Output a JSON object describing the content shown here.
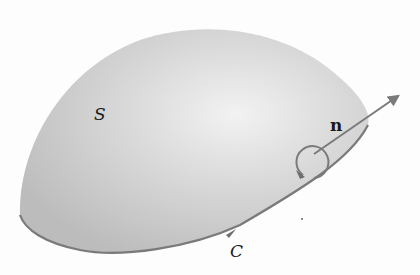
{
  "diagram": {
    "type": "stokes-theorem-surface",
    "labels": {
      "surface": "S",
      "normal": "n",
      "boundary": "C"
    },
    "colors": {
      "background": "#fdfdfd",
      "surface_light": "#f0f0f0",
      "surface_mid": "#d4d4d4",
      "surface_dark": "#bdbdbd",
      "curve": "#7a7a7a",
      "arrow": "#7a7a7a",
      "text": "#1a1a1a"
    }
  }
}
